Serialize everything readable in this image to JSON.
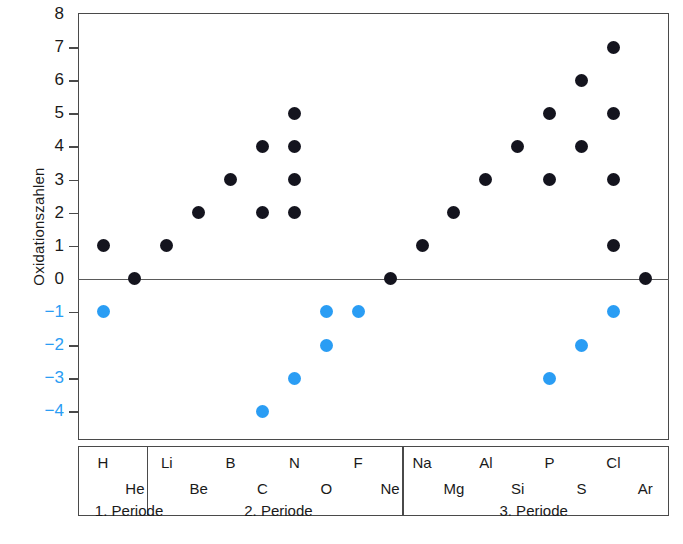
{
  "chart_data": {
    "type": "scatter",
    "title": "",
    "xlabel": "",
    "ylabel": "Oxidationszahlen",
    "ylim": [
      -4,
      8
    ],
    "yticks": [
      8,
      7,
      6,
      5,
      4,
      3,
      2,
      1,
      0,
      "−1",
      "−2",
      "−3",
      "−4"
    ],
    "grid": false,
    "legend": "none",
    "colors": {
      "positive": "#14141e",
      "negative": "#2a9df4",
      "axis": "#4a4a4a",
      "text": "#1a1a1a"
    },
    "series": [
      {
        "name": "positive Oxidationszahlen",
        "color": "#14141e"
      },
      {
        "name": "negative Oxidationszahlen",
        "color": "#2a9df4"
      }
    ],
    "categories": [
      "H",
      "He",
      "Li",
      "Be",
      "B",
      "C",
      "N",
      "O",
      "F",
      "Ne",
      "Na",
      "Mg",
      "Al",
      "Si",
      "P",
      "S",
      "Cl",
      "Ar"
    ],
    "points": [
      {
        "element": "H",
        "values": [
          1,
          -1
        ]
      },
      {
        "element": "He",
        "values": [
          0
        ]
      },
      {
        "element": "Li",
        "values": [
          1
        ]
      },
      {
        "element": "Be",
        "values": [
          2
        ]
      },
      {
        "element": "B",
        "values": [
          3
        ]
      },
      {
        "element": "C",
        "values": [
          4,
          2,
          -4
        ]
      },
      {
        "element": "N",
        "values": [
          5,
          4,
          3,
          2,
          -3
        ]
      },
      {
        "element": "O",
        "values": [
          -1,
          -2
        ]
      },
      {
        "element": "F",
        "values": [
          -1
        ]
      },
      {
        "element": "Ne",
        "values": [
          0
        ]
      },
      {
        "element": "Na",
        "values": [
          1
        ]
      },
      {
        "element": "Mg",
        "values": [
          2
        ]
      },
      {
        "element": "Al",
        "values": [
          3
        ]
      },
      {
        "element": "Si",
        "values": [
          4
        ]
      },
      {
        "element": "P",
        "values": [
          5,
          3,
          -3
        ]
      },
      {
        "element": "S",
        "values": [
          6,
          4,
          -2
        ]
      },
      {
        "element": "Cl",
        "values": [
          7,
          5,
          3,
          1,
          -1
        ]
      },
      {
        "element": "Ar",
        "values": [
          0
        ]
      }
    ]
  },
  "axis": {
    "y_title": "Oxidationszahlen",
    "ticks": [
      {
        "label": "8",
        "value": 8,
        "negative": false
      },
      {
        "label": "7",
        "value": 7,
        "negative": false
      },
      {
        "label": "6",
        "value": 6,
        "negative": false
      },
      {
        "label": "5",
        "value": 5,
        "negative": false
      },
      {
        "label": "4",
        "value": 4,
        "negative": false
      },
      {
        "label": "3",
        "value": 3,
        "negative": false
      },
      {
        "label": "2",
        "value": 2,
        "negative": false
      },
      {
        "label": "1",
        "value": 1,
        "negative": false
      },
      {
        "label": "0",
        "value": 0,
        "negative": false
      },
      {
        "label": "−1",
        "value": -1,
        "negative": true
      },
      {
        "label": "−2",
        "value": -2,
        "negative": true
      },
      {
        "label": "−3",
        "value": -3,
        "negative": true
      },
      {
        "label": "−4",
        "value": -4,
        "negative": true
      }
    ]
  },
  "elements": [
    {
      "symbol": "H",
      "row": "top",
      "col": 0
    },
    {
      "symbol": "He",
      "row": "bottom",
      "col": 1
    },
    {
      "symbol": "Li",
      "row": "top",
      "col": 2
    },
    {
      "symbol": "Be",
      "row": "bottom",
      "col": 3
    },
    {
      "symbol": "B",
      "row": "top",
      "col": 4
    },
    {
      "symbol": "C",
      "row": "bottom",
      "col": 5
    },
    {
      "symbol": "N",
      "row": "top",
      "col": 6
    },
    {
      "symbol": "O",
      "row": "bottom",
      "col": 7
    },
    {
      "symbol": "F",
      "row": "top",
      "col": 8
    },
    {
      "symbol": "Ne",
      "row": "bottom",
      "col": 9
    },
    {
      "symbol": "Na",
      "row": "top",
      "col": 10
    },
    {
      "symbol": "Mg",
      "row": "bottom",
      "col": 11
    },
    {
      "symbol": "Al",
      "row": "top",
      "col": 12
    },
    {
      "symbol": "Si",
      "row": "bottom",
      "col": 13
    },
    {
      "symbol": "P",
      "row": "top",
      "col": 14
    },
    {
      "symbol": "S",
      "row": "bottom",
      "col": 15
    },
    {
      "symbol": "Cl",
      "row": "top",
      "col": 16
    },
    {
      "symbol": "Ar",
      "row": "bottom",
      "col": 17
    }
  ],
  "periods": [
    {
      "label": "1. Periode",
      "start_col": 0,
      "end_col": 1,
      "align": "left"
    },
    {
      "label": "2. Periode",
      "start_col": 2,
      "end_col": 9,
      "align": "center"
    },
    {
      "label": "3. Periode",
      "start_col": 10,
      "end_col": 17,
      "align": "center"
    }
  ]
}
